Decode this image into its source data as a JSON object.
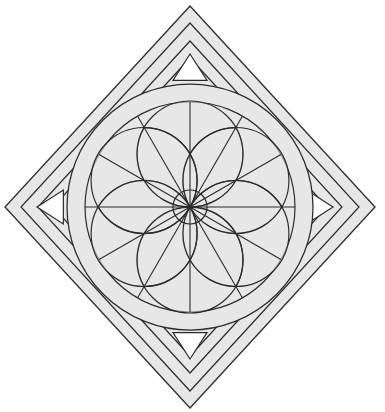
{
  "document": {
    "title": "Geometric Rosette Medallion",
    "canvas": {
      "width": 385,
      "height": 412,
      "background": "#ffffff"
    }
  },
  "style": {
    "panel_fill": "#e7e7e7",
    "stroke": "#2b2b2b",
    "stroke_light": "#3a3a3a",
    "triangle_fill": "#ffffff",
    "stroke_width_outer": 1.3,
    "stroke_width_inner": 1.1,
    "stroke_width_petal": 1.2,
    "stroke_width_hair": 1.0
  },
  "geometry": {
    "center": {
      "x": 190,
      "y": 207
    },
    "diamonds": [
      {
        "name": "diamond-outer",
        "rx": 185,
        "ry": 201,
        "label": "Outer border diamond"
      },
      {
        "name": "diamond-second",
        "rx": 169,
        "ry": 184,
        "label": "Second diamond band"
      },
      {
        "name": "diamond-third",
        "rx": 152,
        "ry": 166,
        "label": "Third diamond band"
      },
      {
        "name": "diamond-inner",
        "rx": 137,
        "ry": 149,
        "label": "Inner diamond band"
      }
    ],
    "circles": [
      {
        "name": "circle-outer",
        "r": 123,
        "label": "Outer ring circle"
      },
      {
        "name": "circle-inner",
        "r": 105,
        "label": "Inner ring circle"
      },
      {
        "name": "circle-hub",
        "r": 17,
        "label": "Central hub circle"
      }
    ],
    "petals": {
      "count": 6,
      "petal_radius": 53,
      "ring_radius": 53,
      "start_angle_deg": -90,
      "label": "Six-petal rosette"
    },
    "spokes": {
      "count": 12,
      "label": "Radial spoke lines"
    },
    "triangles": [
      {
        "name": "triangle-north",
        "direction": "up",
        "cx": 190,
        "cy": 71,
        "size": 17
      },
      {
        "name": "triangle-east",
        "direction": "right",
        "cx": 316,
        "cy": 207,
        "size": 17
      },
      {
        "name": "triangle-south",
        "direction": "down",
        "cx": 190,
        "cy": 342,
        "size": 17
      },
      {
        "name": "triangle-west",
        "direction": "left",
        "cx": 54,
        "cy": 207,
        "size": 17
      }
    ]
  },
  "chart_data": {
    "type": "diagram",
    "elements": [
      "nested diamond frames (4)",
      "concentric circles (2)",
      "six-petal rosette",
      "central hub circle",
      "12 radial spokes",
      "4 directional triangles"
    ]
  }
}
